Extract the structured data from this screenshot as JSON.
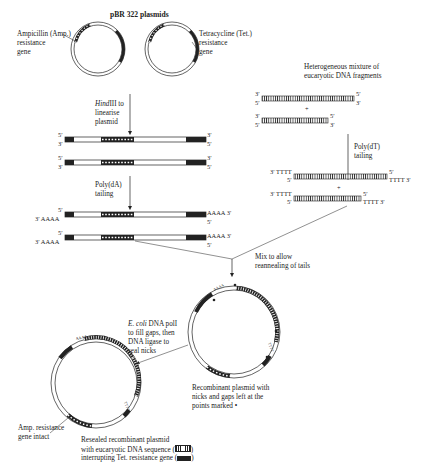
{
  "title": "pBR 322 plasmids",
  "plasmid_labels": {
    "ampicillin": [
      "Ampicillin (Amp.)",
      "resistance",
      "gene"
    ],
    "tetracycline": [
      "Tetracycline (Tet.)",
      "resistance",
      "gene"
    ]
  },
  "steps": {
    "hindiii_italic": "Hind",
    "hindiii_rest": "III to",
    "hindiii_line2": "linearise",
    "hindiii_line3": "plasmid",
    "polyda_line1": "Poly(dA)",
    "polyda_line2": "tailing",
    "polydt_line1": "Poly(dT)",
    "polydt_line2": "tailing",
    "mix_line1": "Mix to allow",
    "mix_line2": "reannealing of tails",
    "ecoli_italic": "E. coli",
    "ecoli_rest": " DNA polI",
    "ecoli_line2": "to fill gaps, then",
    "ecoli_line3": "DNA ligase to",
    "ecoli_line4": "seal nicks"
  },
  "fragments_label": [
    "Heterogeneous mixture of",
    "eucaryotic DNA fragments"
  ],
  "strand_ends": {
    "five": "5′",
    "three": "3′",
    "plus": "+",
    "aaaa_right": "AAAA 3′",
    "aaaa_left": "3′ AAAA",
    "tttt_left": "3′ TTTT",
    "tttt_right": "TTTT 3′"
  },
  "recombinant_caption": [
    "Recombinant plasmid with",
    "nicks and gaps left at the",
    "points marked •"
  ],
  "amp_intact": [
    "Amp. resistance",
    "gene intact"
  ],
  "resealed_caption": [
    "Resealed recombinant plasmid",
    "with eucaryotic DNA sequence (",
    "interrupting Tet. resistance gene ("
  ],
  "legend_close": ")",
  "legend": {
    "eucaryotic_dna": "hatched-box",
    "tet_gene": "black-box"
  },
  "colors": {
    "ink": "#222222",
    "background": "#ffffff"
  }
}
